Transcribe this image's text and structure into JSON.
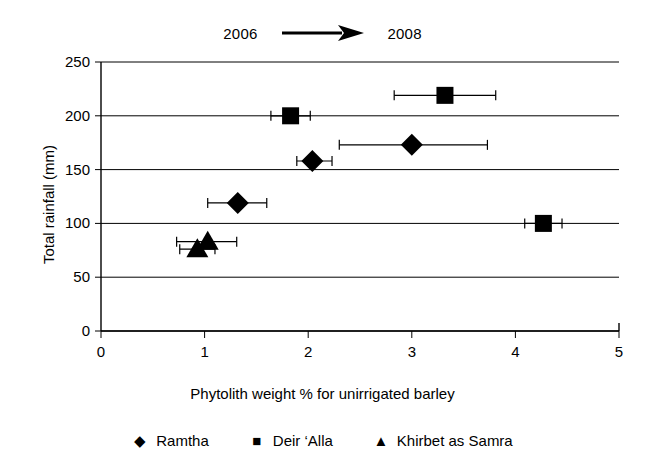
{
  "header": {
    "left_year": "2006",
    "right_year": "2008",
    "arrow_icon": "right-arrow-icon"
  },
  "chart_data": {
    "type": "scatter",
    "title": "",
    "xlabel": "Phytolith weight % for unirrigated barley",
    "ylabel": "Total rainfall (mm)",
    "xlim": [
      0,
      5
    ],
    "ylim": [
      0,
      250
    ],
    "xticks": [
      "0",
      "1",
      "2",
      "3",
      "4",
      "5"
    ],
    "yticks": [
      "0",
      "50",
      "100",
      "150",
      "200",
      "250"
    ],
    "grid": "horizontal",
    "legend_position": "bottom",
    "error_bars": "horizontal",
    "series": [
      {
        "name": "Ramtha",
        "marker": "diamond",
        "color": "#000000",
        "points": [
          {
            "label": "2006",
            "x": 1.32,
            "y": 119,
            "xerr_low": 1.03,
            "xerr_high": 1.6
          },
          {
            "label": "2007",
            "x": 2.04,
            "y": 158,
            "xerr_low": 1.89,
            "xerr_high": 2.23
          },
          {
            "label": "2008",
            "x": 3.0,
            "y": 173,
            "xerr_low": 2.3,
            "xerr_high": 3.73
          }
        ]
      },
      {
        "name": "Deir 'Alla",
        "marker": "square",
        "color": "#000000",
        "points": [
          {
            "label": "2006",
            "x": 1.83,
            "y": 200,
            "xerr_low": 1.64,
            "xerr_high": 2.02
          },
          {
            "label": "2007",
            "x": 3.32,
            "y": 219,
            "xerr_low": 2.83,
            "xerr_high": 3.81
          },
          {
            "label": "2008",
            "x": 4.27,
            "y": 100,
            "xerr_low": 4.09,
            "xerr_high": 4.45
          }
        ]
      },
      {
        "name": "Khirbet as Samra",
        "marker": "triangle",
        "color": "#000000",
        "points": [
          {
            "label": "2006",
            "x": 1.03,
            "y": 83,
            "xerr_low": 0.73,
            "xerr_high": 1.31
          },
          {
            "label": "2007",
            "x": 0.93,
            "y": 76,
            "xerr_low": 0.76,
            "xerr_high": 1.1
          }
        ]
      }
    ]
  },
  "legend": {
    "items": [
      {
        "label": "Ramtha",
        "glyph": "◆",
        "marker": "diamond"
      },
      {
        "label": "Deir ‘Alla",
        "glyph": "■",
        "marker": "square"
      },
      {
        "label": "Khirbet as Samra",
        "glyph": "▲",
        "marker": "triangle"
      }
    ]
  }
}
